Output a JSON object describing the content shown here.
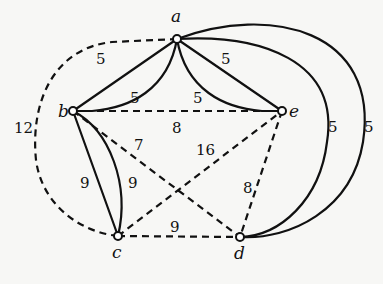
{
  "graph": {
    "vertices": [
      {
        "id": "a",
        "label": "a"
      },
      {
        "id": "b",
        "label": "b"
      },
      {
        "id": "c",
        "label": "c"
      },
      {
        "id": "d",
        "label": "d"
      },
      {
        "id": "e",
        "label": "e"
      }
    ],
    "edges": [
      {
        "id": "ab-straight",
        "from": "a",
        "to": "b",
        "weight": "5",
        "style": "solid"
      },
      {
        "id": "ab-curved",
        "from": "a",
        "to": "b",
        "weight": "5",
        "style": "solid"
      },
      {
        "id": "ae-straight",
        "from": "a",
        "to": "e",
        "weight": "5",
        "style": "solid"
      },
      {
        "id": "ae-curved",
        "from": "a",
        "to": "e",
        "weight": "5",
        "style": "solid"
      },
      {
        "id": "ad-inner",
        "from": "a",
        "to": "d",
        "weight": "5",
        "style": "solid"
      },
      {
        "id": "ad-outer",
        "from": "a",
        "to": "d",
        "weight": "5",
        "style": "solid"
      },
      {
        "id": "bc-straight",
        "from": "b",
        "to": "c",
        "weight": "9",
        "style": "solid"
      },
      {
        "id": "bc-curved",
        "from": "b",
        "to": "c",
        "weight": "9",
        "style": "solid"
      },
      {
        "id": "be",
        "from": "b",
        "to": "e",
        "weight": "8",
        "style": "dashed"
      },
      {
        "id": "bd",
        "from": "b",
        "to": "d",
        "weight": "7",
        "style": "dashed"
      },
      {
        "id": "ce",
        "from": "c",
        "to": "e",
        "weight": "16",
        "style": "dashed"
      },
      {
        "id": "ed",
        "from": "e",
        "to": "d",
        "weight": "8",
        "style": "dashed"
      },
      {
        "id": "cd",
        "from": "c",
        "to": "d",
        "weight": "9",
        "style": "dashed"
      },
      {
        "id": "ac-arc",
        "from": "a",
        "to": "c",
        "weight": "12",
        "style": "dashed"
      }
    ]
  }
}
